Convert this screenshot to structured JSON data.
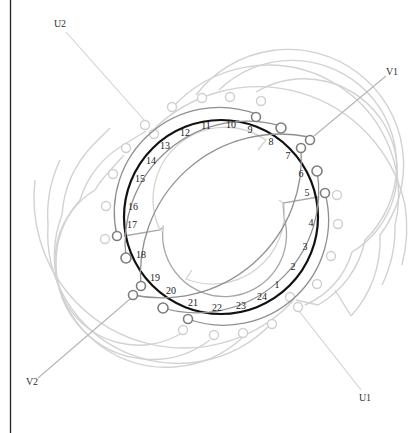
{
  "diagram": {
    "slot_count": 24,
    "slots": [
      {
        "n": "1",
        "x": 264,
        "y": 292
      },
      {
        "n": "2",
        "x": 293,
        "y": 268
      },
      {
        "n": "3",
        "x": 305,
        "y": 248
      },
      {
        "n": "4",
        "x": 311,
        "y": 224
      },
      {
        "n": "5",
        "x": 307,
        "y": 194
      },
      {
        "n": "6",
        "x": 301,
        "y": 175
      },
      {
        "n": "7",
        "x": 288,
        "y": 157
      },
      {
        "n": "8",
        "x": 271,
        "y": 143
      },
      {
        "n": "9",
        "x": 250,
        "y": 130
      },
      {
        "n": "10",
        "x": 231,
        "y": 126
      },
      {
        "n": "11",
        "x": 206,
        "y": 127
      },
      {
        "n": "12",
        "x": 185,
        "y": 134
      },
      {
        "n": "13",
        "x": 164,
        "y": 147
      },
      {
        "n": "14",
        "x": 151,
        "y": 161
      },
      {
        "n": "15",
        "x": 140,
        "y": 180
      },
      {
        "n": "16",
        "x": 133,
        "y": 208
      },
      {
        "n": "17",
        "x": 131,
        "y": 226
      },
      {
        "n": "18",
        "x": 140,
        "y": 256
      },
      {
        "n": "19",
        "x": 154,
        "y": 280
      },
      {
        "n": "20",
        "x": 171,
        "y": 293
      },
      {
        "n": "21",
        "x": 193,
        "y": 304
      },
      {
        "n": "22",
        "x": 217,
        "y": 310
      },
      {
        "n": "23",
        "x": 241,
        "y": 308
      },
      {
        "n": "24",
        "x": 262,
        "y": 299
      }
    ],
    "terminals": [
      {
        "label": "U1",
        "x": 365,
        "y": 398
      },
      {
        "label": "U2",
        "x": 60,
        "y": 25
      },
      {
        "label": "V1",
        "x": 392,
        "y": 73
      },
      {
        "label": "V2",
        "x": 32,
        "y": 383
      }
    ],
    "phases": [
      {
        "name": "U",
        "color": "#d2d2d2"
      },
      {
        "name": "V",
        "color": "#8f8f8f"
      }
    ],
    "colors": {
      "stator": "#111111",
      "phase_u": "#d2d2d2",
      "phase_v": "#8f8f8f",
      "rotor": "#a8a8a8",
      "background": "#ffffff",
      "border": "#222222"
    }
  }
}
